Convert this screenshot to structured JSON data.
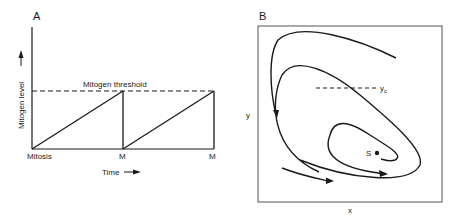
{
  "panel_a": {
    "panel_label": "A",
    "y_axis_label": "Mitogen level",
    "x_axis_label": "Time",
    "threshold_label": "Mitogen threshold",
    "tick_labels": [
      "Mitosis",
      "M",
      "M"
    ],
    "arrow_icon": "right-arrow"
  },
  "panel_b": {
    "panel_label": "B",
    "x_axis_label": "x",
    "y_axis_label": "y",
    "critical_label": "y",
    "critical_subscript": "c",
    "steady_state_label": "S"
  },
  "chart_data": [
    {
      "type": "line",
      "title": "A",
      "xlabel": "Time",
      "ylabel": "Mitogen level",
      "x_tick_labels": [
        "Mitosis",
        "M",
        "M"
      ],
      "series": [
        {
          "name": "Mitogen level",
          "x": [
            0,
            1,
            1,
            2,
            2
          ],
          "y": [
            0,
            1,
            0,
            1,
            0
          ]
        }
      ],
      "threshold": {
        "label": "Mitogen threshold",
        "value": 1
      },
      "xlim": [
        0,
        2
      ],
      "ylim": [
        0,
        1.7
      ]
    },
    {
      "type": "line",
      "title": "B",
      "xlabel": "x",
      "ylabel": "y",
      "annotations": [
        "y_c (critical y, dashed)",
        "S (steady state point)"
      ],
      "description": "Phase-plane trajectories spiralling inward toward steady state S"
    }
  ]
}
